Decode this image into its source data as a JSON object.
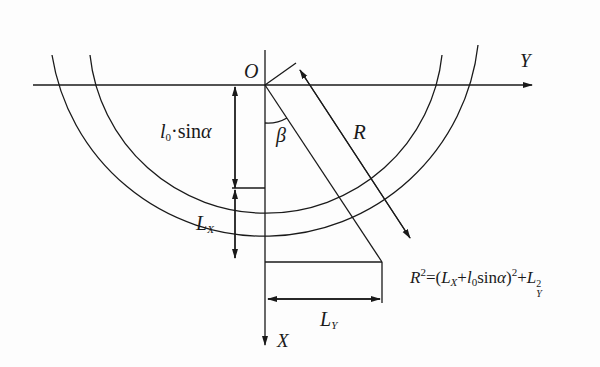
{
  "diagram": {
    "labels": {
      "origin": "O",
      "y_axis": "Y",
      "x_axis": "X",
      "beta": "β",
      "radius": "R",
      "l0_sin_alpha": {
        "l": "l",
        "sub": "0",
        "rest": "·sin",
        "alpha": "α"
      },
      "lx": {
        "main": "L",
        "sub": "X"
      },
      "ly": {
        "main": "L",
        "sub": "Y"
      },
      "formula": {
        "r": "R",
        "r_sup": "2",
        "eq_open": "=(",
        "lx_main": "L",
        "lx_sub": "X",
        "plus1": "+",
        "l": "l",
        "l_sub": "0",
        "sin": "sin",
        "alpha": "α",
        "close": ")",
        "close_sup": "2",
        "plus2": "+",
        "ly_main": "L",
        "ly_sup": "2",
        "ly_sub": "Y"
      }
    },
    "colors": {
      "line": "#1a1a1a",
      "background": "#fdfdfd"
    }
  }
}
